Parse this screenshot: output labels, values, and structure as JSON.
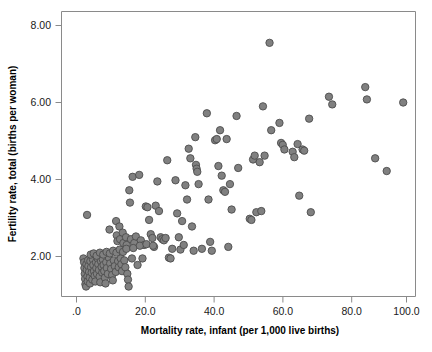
{
  "chart_data": {
    "type": "scatter",
    "title": "",
    "xlabel": "Mortality rate, infant (per 1,000 live births)",
    "ylabel": "Fertility rate, total (births per woman)",
    "xlim": [
      -4.0,
      106.0
    ],
    "ylim": [
      0.85,
      8.55
    ],
    "xticks": [
      0,
      20,
      40,
      60,
      80,
      100
    ],
    "xticklabels": [
      ".0",
      "20.0",
      "40.0",
      "60.0",
      "80.0",
      "100.0"
    ],
    "yticks": [
      2,
      4,
      6,
      8
    ],
    "yticklabels": [
      "2.00",
      "4.00",
      "6.00",
      "8.00"
    ],
    "grid": false,
    "legend": null,
    "marker": {
      "shape": "circle",
      "fill_color": "#808080",
      "edge_color": "#4d4d4d",
      "diameter_px": 7.4
    },
    "n_points": 185,
    "points": [
      [
        3.2,
        3.08
      ],
      [
        2.1,
        1.95
      ],
      [
        2.3,
        1.85
      ],
      [
        2.4,
        1.7
      ],
      [
        2.5,
        1.55
      ],
      [
        2.6,
        1.42
      ],
      [
        2.7,
        1.28
      ],
      [
        2.9,
        1.22
      ],
      [
        3.0,
        1.8
      ],
      [
        3.1,
        1.65
      ],
      [
        3.3,
        1.48
      ],
      [
        3.4,
        1.35
      ],
      [
        3.5,
        1.9
      ],
      [
        3.6,
        1.75
      ],
      [
        3.8,
        1.6
      ],
      [
        4.0,
        1.45
      ],
      [
        4.1,
        1.3
      ],
      [
        4.2,
        1.88
      ],
      [
        4.4,
        1.72
      ],
      [
        4.6,
        1.58
      ],
      [
        4.8,
        1.4
      ],
      [
        5.0,
        1.92
      ],
      [
        5.1,
        1.78
      ],
      [
        5.3,
        1.62
      ],
      [
        5.5,
        1.5
      ],
      [
        5.7,
        1.35
      ],
      [
        5.9,
        1.85
      ],
      [
        6.0,
        1.7
      ],
      [
        6.2,
        1.55
      ],
      [
        6.4,
        1.95
      ],
      [
        6.6,
        1.8
      ],
      [
        6.8,
        1.65
      ],
      [
        7.0,
        1.48
      ],
      [
        7.2,
        1.33
      ],
      [
        7.4,
        1.88
      ],
      [
        7.6,
        1.73
      ],
      [
        7.8,
        1.58
      ],
      [
        8.0,
        1.92
      ],
      [
        8.2,
        1.78
      ],
      [
        8.4,
        1.62
      ],
      [
        8.6,
        1.45
      ],
      [
        8.8,
        1.3
      ],
      [
        9.0,
        1.85
      ],
      [
        9.2,
        1.7
      ],
      [
        9.5,
        1.55
      ],
      [
        9.8,
        1.97
      ],
      [
        10.0,
        2.7
      ],
      [
        10.2,
        1.82
      ],
      [
        10.5,
        1.68
      ],
      [
        10.8,
        1.52
      ],
      [
        11.0,
        1.38
      ],
      [
        11.3,
        1.9
      ],
      [
        11.6,
        1.75
      ],
      [
        11.9,
        1.6
      ],
      [
        12.0,
        2.92
      ],
      [
        12.2,
        2.55
      ],
      [
        12.4,
        2.4
      ],
      [
        12.6,
        1.88
      ],
      [
        12.8,
        1.72
      ],
      [
        13.0,
        2.78
      ],
      [
        13.2,
        2.45
      ],
      [
        13.4,
        1.95
      ],
      [
        13.6,
        1.8
      ],
      [
        13.8,
        1.62
      ],
      [
        14.0,
        2.62
      ],
      [
        14.2,
        2.35
      ],
      [
        14.5,
        1.9
      ],
      [
        14.8,
        1.72
      ],
      [
        15.0,
        2.5
      ],
      [
        15.2,
        2.3
      ],
      [
        15.4,
        1.55
      ],
      [
        15.6,
        1.4
      ],
      [
        15.8,
        1.22
      ],
      [
        16.0,
        3.72
      ],
      [
        16.2,
        3.4
      ],
      [
        16.5,
        2.45
      ],
      [
        16.8,
        1.95
      ],
      [
        17.0,
        4.07
      ],
      [
        17.5,
        2.35
      ],
      [
        18.0,
        2.52
      ],
      [
        18.5,
        1.78
      ],
      [
        19.0,
        4.12
      ],
      [
        19.5,
        2.42
      ],
      [
        20.0,
        1.95
      ],
      [
        20.5,
        2.3
      ],
      [
        21.0,
        3.3
      ],
      [
        21.5,
        3.28
      ],
      [
        22.0,
        2.95
      ],
      [
        22.5,
        2.58
      ],
      [
        23.0,
        2.48
      ],
      [
        23.5,
        2.25
      ],
      [
        24.0,
        3.32
      ],
      [
        24.5,
        3.95
      ],
      [
        25.0,
        3.18
      ],
      [
        25.5,
        2.5
      ],
      [
        26.0,
        2.45
      ],
      [
        26.5,
        2.42
      ],
      [
        27.0,
        2.48
      ],
      [
        27.5,
        4.5
      ],
      [
        28.0,
        1.97
      ],
      [
        28.5,
        1.95
      ],
      [
        29.0,
        2.2
      ],
      [
        30.0,
        3.98
      ],
      [
        30.5,
        3.12
      ],
      [
        31.0,
        2.5
      ],
      [
        31.5,
        2.18
      ],
      [
        32.0,
        2.92
      ],
      [
        32.5,
        2.3
      ],
      [
        33.0,
        3.85
      ],
      [
        33.5,
        3.48
      ],
      [
        34.0,
        4.8
      ],
      [
        34.5,
        4.55
      ],
      [
        35.0,
        2.78
      ],
      [
        35.5,
        2.15
      ],
      [
        36.0,
        5.1
      ],
      [
        36.2,
        4.38
      ],
      [
        36.4,
        4.28
      ],
      [
        36.6,
        4.2
      ],
      [
        37.0,
        3.88
      ],
      [
        38.0,
        2.2
      ],
      [
        39.5,
        5.72
      ],
      [
        40.0,
        3.48
      ],
      [
        40.5,
        2.38
      ],
      [
        41.0,
        2.15
      ],
      [
        42.0,
        5.02
      ],
      [
        42.5,
        5.05
      ],
      [
        43.0,
        4.35
      ],
      [
        43.5,
        5.28
      ],
      [
        44.0,
        4.1
      ],
      [
        44.5,
        3.72
      ],
      [
        45.0,
        3.68
      ],
      [
        45.5,
        5.05
      ],
      [
        46.0,
        2.25
      ],
      [
        46.5,
        3.88
      ],
      [
        47.0,
        3.22
      ],
      [
        48.5,
        5.65
      ],
      [
        49.0,
        4.3
      ],
      [
        52.5,
        2.98
      ],
      [
        53.0,
        2.95
      ],
      [
        53.5,
        4.52
      ],
      [
        54.0,
        4.62
      ],
      [
        54.5,
        3.15
      ],
      [
        55.5,
        4.45
      ],
      [
        56.0,
        3.18
      ],
      [
        56.5,
        5.9
      ],
      [
        57.0,
        4.62
      ],
      [
        58.5,
        7.55
      ],
      [
        59.0,
        5.28
      ],
      [
        61.5,
        5.47
      ],
      [
        62.0,
        4.95
      ],
      [
        62.5,
        4.9
      ],
      [
        63.0,
        4.78
      ],
      [
        65.5,
        4.72
      ],
      [
        66.0,
        4.58
      ],
      [
        67.0,
        4.92
      ],
      [
        67.5,
        3.58
      ],
      [
        68.5,
        4.78
      ],
      [
        69.0,
        4.75
      ],
      [
        70.5,
        5.58
      ],
      [
        71.0,
        3.15
      ],
      [
        76.5,
        6.15
      ],
      [
        77.5,
        5.95
      ],
      [
        87.5,
        6.4
      ],
      [
        88.0,
        6.08
      ],
      [
        90.5,
        4.55
      ],
      [
        94.0,
        4.22
      ],
      [
        99.0,
        6.0
      ],
      [
        4.3,
        2.05
      ],
      [
        5.2,
        2.08
      ],
      [
        6.1,
        2.02
      ],
      [
        7.1,
        2.1
      ],
      [
        8.1,
        2.05
      ],
      [
        9.1,
        2.12
      ],
      [
        10.1,
        2.08
      ],
      [
        11.1,
        2.15
      ],
      [
        12.1,
        2.1
      ],
      [
        13.1,
        2.18
      ],
      [
        14.1,
        2.12
      ],
      [
        15.1,
        2.2
      ],
      [
        17.2,
        2.22
      ],
      [
        19.2,
        2.28
      ],
      [
        21.2,
        2.32
      ],
      [
        23.2,
        2.28
      ]
    ]
  }
}
